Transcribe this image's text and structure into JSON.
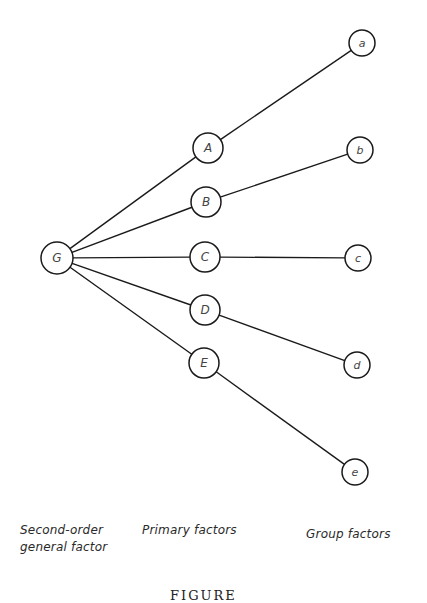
{
  "diagram": {
    "type": "hierarchical factor tree",
    "nodes": [
      {
        "id": "G",
        "label": "G",
        "x": 57,
        "y": 258,
        "r": 16,
        "level": "second-order"
      },
      {
        "id": "A",
        "label": "A",
        "x": 208,
        "y": 148,
        "r": 15,
        "level": "primary"
      },
      {
        "id": "B",
        "label": "B",
        "x": 206,
        "y": 202,
        "r": 15,
        "level": "primary"
      },
      {
        "id": "C",
        "label": "C",
        "x": 205,
        "y": 257,
        "r": 15,
        "level": "primary"
      },
      {
        "id": "D",
        "label": "D",
        "x": 205,
        "y": 310,
        "r": 15,
        "level": "primary"
      },
      {
        "id": "E",
        "label": "E",
        "x": 204,
        "y": 363,
        "r": 15,
        "level": "primary"
      },
      {
        "id": "a",
        "label": "a",
        "x": 362,
        "y": 43,
        "r": 13,
        "level": "group"
      },
      {
        "id": "b",
        "label": "b",
        "x": 360,
        "y": 150,
        "r": 13,
        "level": "group"
      },
      {
        "id": "c",
        "label": "c",
        "x": 358,
        "y": 258,
        "r": 13,
        "level": "group"
      },
      {
        "id": "d",
        "label": "d",
        "x": 357,
        "y": 365,
        "r": 13,
        "level": "group"
      },
      {
        "id": "e",
        "label": "e",
        "x": 355,
        "y": 472,
        "r": 13,
        "level": "group"
      }
    ],
    "edges": [
      [
        "G",
        "A"
      ],
      [
        "G",
        "B"
      ],
      [
        "G",
        "C"
      ],
      [
        "G",
        "D"
      ],
      [
        "G",
        "E"
      ],
      [
        "A",
        "a"
      ],
      [
        "B",
        "b"
      ],
      [
        "C",
        "c"
      ],
      [
        "D",
        "d"
      ],
      [
        "E",
        "e"
      ]
    ],
    "column_labels": {
      "second_order_line1": "Second-order",
      "second_order_line2": "general factor",
      "primary": "Primary factors",
      "group": "Group factors"
    },
    "caption": "FIGURE"
  },
  "colors": {
    "stroke": "#1a1a1a",
    "text": "#2a2a2a",
    "background": "#ffffff"
  }
}
